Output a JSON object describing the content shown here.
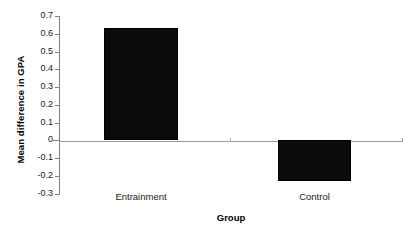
{
  "chart_data": {
    "type": "bar",
    "title": "",
    "subtitle": "",
    "xlabel": "Group",
    "ylabel": "Mean difference in GPA",
    "categories": [
      "Entrainment",
      "Control"
    ],
    "values": [
      0.63,
      -0.23
    ],
    "series": [
      {
        "name": "Mean difference in GPA",
        "values": [
          0.63,
          -0.23
        ],
        "color": "#0b0b0b"
      }
    ],
    "ylim": [
      -0.3,
      0.7
    ],
    "ytick_values": [
      0.7,
      0.6,
      0.5,
      0.4,
      0.3,
      0.2,
      0.1,
      0,
      -0.1,
      -0.2,
      -0.3
    ],
    "ytick_labels": [
      "0.7",
      "0.6",
      "0.5",
      "0.4",
      "0.3",
      "0.2",
      "0.1",
      "0",
      "-0.1",
      "-0.2",
      "-0.3"
    ],
    "xtick_labels": [
      "Entrainment",
      "Control"
    ],
    "grid": false,
    "legend": false,
    "legend_position": "none",
    "baseline_value": 0,
    "annotations": []
  },
  "colors": {
    "bar_fill": "#0b0b0b",
    "bar_edge": "#000000",
    "axis": "#808080",
    "baseline": "#9a9a9a",
    "text": "#1a1a1a",
    "background": "#ffffff"
  }
}
